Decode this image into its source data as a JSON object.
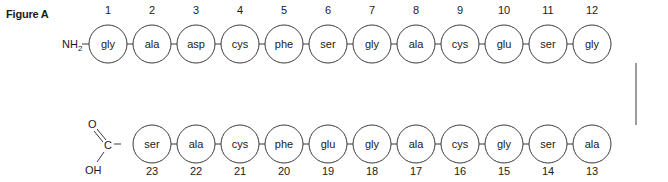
{
  "figure": {
    "label": "Figure A",
    "n_terminus": "NH",
    "n_terminus_subscript": "2",
    "c_terminus": {
      "carbon": "C",
      "carbonyl_oxygen": "O",
      "hydroxyl": "OH"
    },
    "top_row": [
      {
        "position": "1",
        "residue": "gly"
      },
      {
        "position": "2",
        "residue": "ala"
      },
      {
        "position": "3",
        "residue": "asp"
      },
      {
        "position": "4",
        "residue": "cys"
      },
      {
        "position": "5",
        "residue": "phe"
      },
      {
        "position": "6",
        "residue": "ser"
      },
      {
        "position": "7",
        "residue": "gly"
      },
      {
        "position": "8",
        "residue": "ala"
      },
      {
        "position": "9",
        "residue": "cys"
      },
      {
        "position": "10",
        "residue": "glu"
      },
      {
        "position": "11",
        "residue": "ser"
      },
      {
        "position": "12",
        "residue": "gly"
      }
    ],
    "bottom_row": [
      {
        "position": "23",
        "residue": "ser"
      },
      {
        "position": "22",
        "residue": "ala"
      },
      {
        "position": "21",
        "residue": "cys"
      },
      {
        "position": "20",
        "residue": "phe"
      },
      {
        "position": "19",
        "residue": "glu"
      },
      {
        "position": "18",
        "residue": "gly"
      },
      {
        "position": "17",
        "residue": "ala"
      },
      {
        "position": "16",
        "residue": "cys"
      },
      {
        "position": "15",
        "residue": "gly"
      },
      {
        "position": "14",
        "residue": "ser"
      },
      {
        "position": "13",
        "residue": "ala"
      }
    ],
    "colors": {
      "stroke": "#3a3a3a",
      "text": "#1a1a1a",
      "fill": "#ffffff"
    }
  }
}
